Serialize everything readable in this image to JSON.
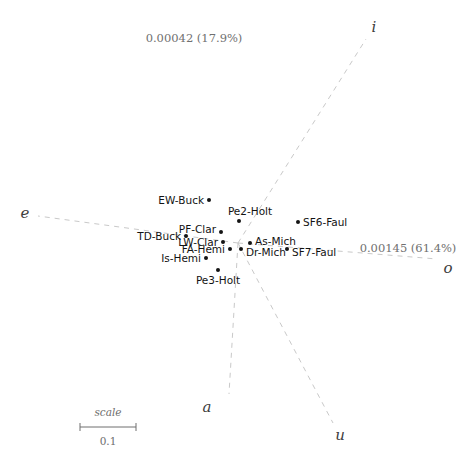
{
  "chart_data": {
    "type": "scatter",
    "title": "",
    "subtitle": "",
    "xlabel": "0.00145 (61.4%)",
    "ylabel": "0.00042 (17.9%)",
    "grid": false,
    "legend": "none",
    "xlim": [
      0,
      460
    ],
    "ylim": [
      461,
      0
    ],
    "annotations": {
      "variance_horizontal": "0.00145 (61.4%)",
      "variance_vertical": "0.00042 (17.9%)",
      "scale_caption": "scale",
      "scale_value": "0.1"
    },
    "vector_axes": [
      {
        "label": "i",
        "label_x": 374,
        "label_y": 27,
        "x1": 238,
        "y1": 243,
        "x2": 366,
        "y2": 39
      },
      {
        "label": "o",
        "label_x": 448,
        "label_y": 268,
        "x1": 238,
        "y1": 243,
        "x2": 437,
        "y2": 259
      },
      {
        "label": "u",
        "label_x": 340,
        "label_y": 435,
        "x1": 238,
        "y1": 243,
        "x2": 333,
        "y2": 423
      },
      {
        "label": "a",
        "label_x": 207,
        "label_y": 407,
        "x1": 238,
        "y1": 243,
        "x2": 229,
        "y2": 394
      },
      {
        "label": "e",
        "label_x": 25,
        "label_y": 213,
        "x1": 238,
        "y1": 243,
        "x2": 38,
        "y2": 216
      }
    ],
    "points": [
      {
        "name": "EW-Buck",
        "x": 209,
        "y": 200,
        "label_side": "left",
        "label_x": 204,
        "label_y": 200
      },
      {
        "name": "Pe2-Holt",
        "x": 239,
        "y": 221,
        "label_side": "above",
        "label_x": 250,
        "label_y": 216
      },
      {
        "name": "SF6-Faul",
        "x": 298,
        "y": 222,
        "label_side": "right",
        "label_x": 303,
        "label_y": 222
      },
      {
        "name": "PF-Clar",
        "x": 221,
        "y": 232,
        "label_side": "left",
        "label_x": 216,
        "label_y": 229
      },
      {
        "name": "TD-Buck",
        "x": 186,
        "y": 236,
        "label_side": "left",
        "label_x": 181,
        "label_y": 236
      },
      {
        "name": "LW-Clar",
        "x": 223,
        "y": 242,
        "label_side": "left",
        "label_x": 218,
        "label_y": 242
      },
      {
        "name": "As-Mich",
        "x": 250,
        "y": 243,
        "label_side": "right",
        "label_x": 255,
        "label_y": 241
      },
      {
        "name": "FA-Hemi",
        "x": 230,
        "y": 249,
        "label_side": "left",
        "label_x": 225,
        "label_y": 249
      },
      {
        "name": "Dr-Mich",
        "x": 241,
        "y": 249,
        "label_side": "right",
        "label_x": 246,
        "label_y": 252
      },
      {
        "name": "SF7-Faul",
        "x": 287,
        "y": 249,
        "label_side": "right",
        "label_x": 292,
        "label_y": 252
      },
      {
        "name": "Is-Hemi",
        "x": 206,
        "y": 258,
        "label_side": "left",
        "label_x": 201,
        "label_y": 258
      },
      {
        "name": "Pe3-Holt",
        "x": 218,
        "y": 270,
        "label_side": "below",
        "label_x": 218,
        "label_y": 275
      }
    ],
    "scale_bar": {
      "x1": 80,
      "x2": 136,
      "y": 427
    }
  },
  "colors": {
    "point": "#141414",
    "axis_line": "#c9c9c9",
    "axis_letter": "#3d3d3d",
    "variance_text": "#707070",
    "scale_text": "#6e6e6e",
    "background": "#ffffff"
  }
}
